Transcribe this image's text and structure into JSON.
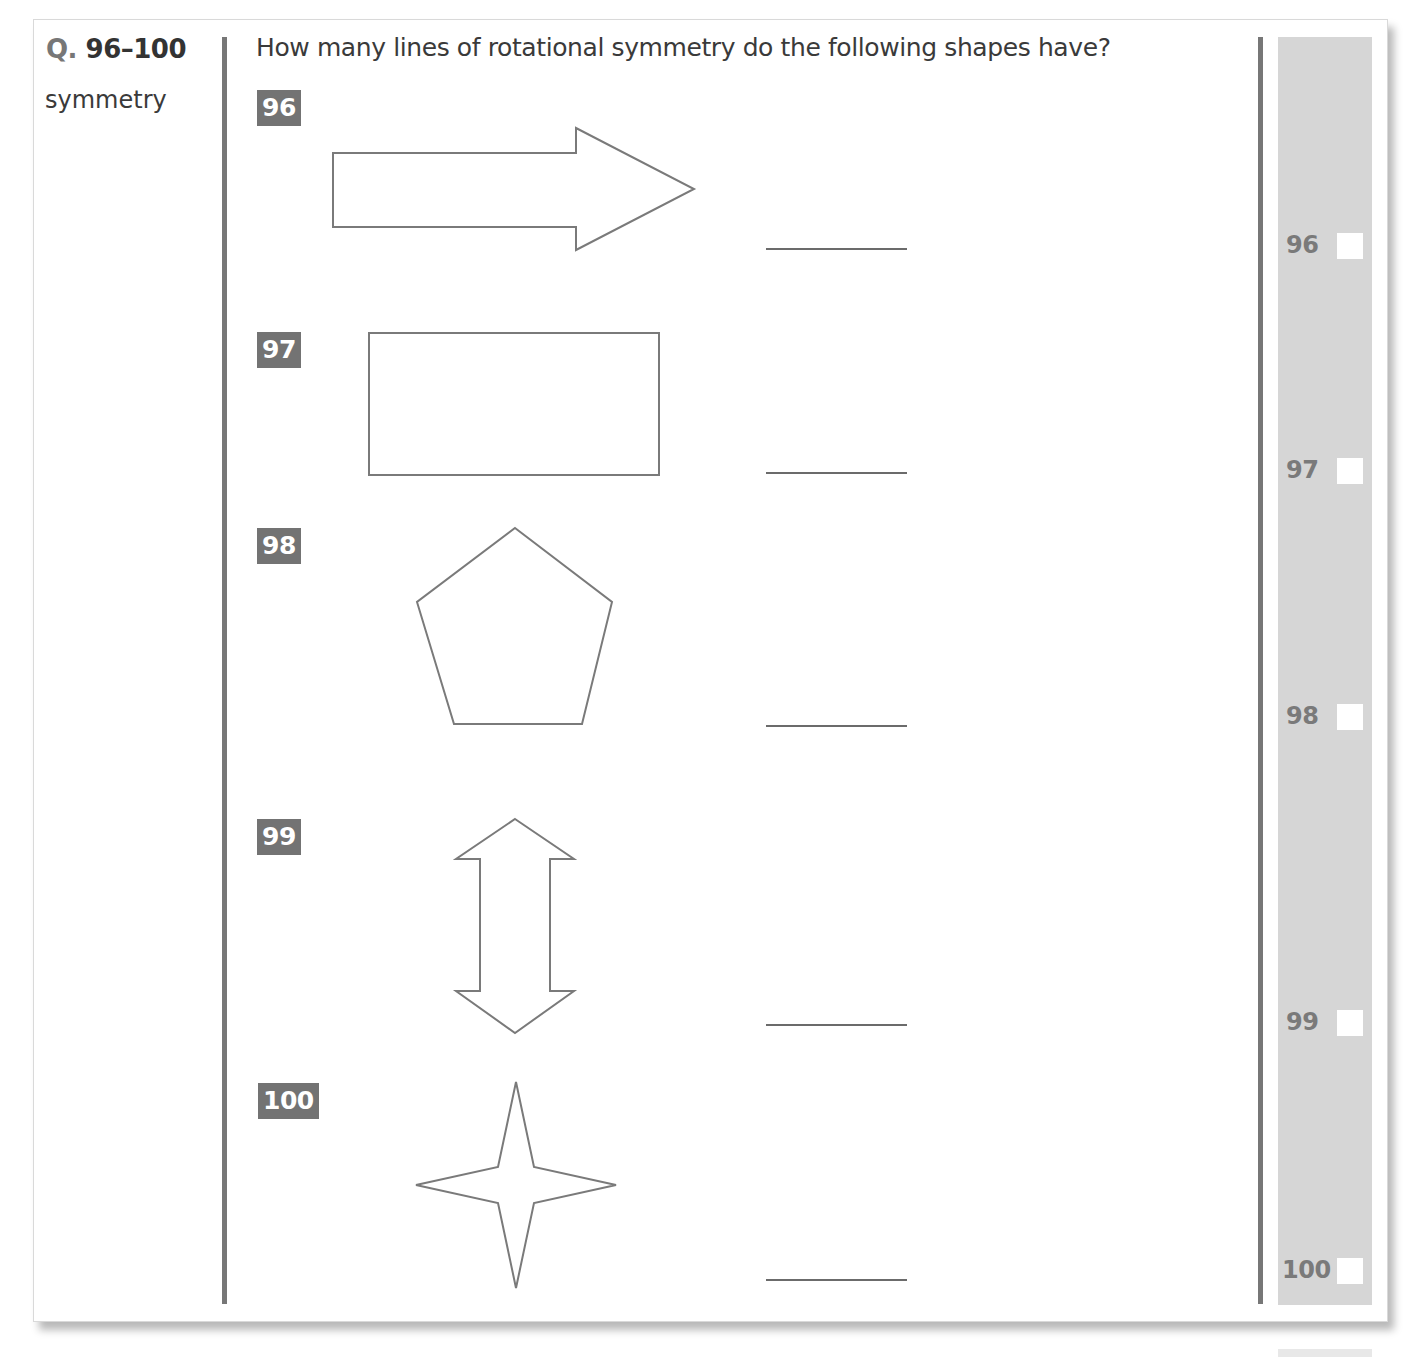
{
  "header": {
    "q_prefix": "Q.",
    "q_range": " 96–100",
    "topic": "symmetry"
  },
  "question_text": "How many lines of rotational symmetry do the following shapes have?",
  "items": [
    {
      "number": "96",
      "shape": "arrow-right",
      "answer": ""
    },
    {
      "number": "97",
      "shape": "rectangle",
      "answer": ""
    },
    {
      "number": "98",
      "shape": "regular-pentagon",
      "answer": ""
    },
    {
      "number": "99",
      "shape": "double-headed-vertical-arrow",
      "answer": ""
    },
    {
      "number": "100",
      "shape": "four-pointed-star",
      "answer": ""
    }
  ],
  "margin": {
    "marks": [
      {
        "number": "96"
      },
      {
        "number": "97"
      },
      {
        "number": "98"
      },
      {
        "number": "99"
      },
      {
        "number": "100"
      }
    ]
  },
  "colors": {
    "badge_bg": "#737373",
    "rule": "#777777",
    "margin_bg": "#d6d6d6",
    "shape_stroke": "#7a7a7a",
    "text": "#3a3a3a"
  }
}
